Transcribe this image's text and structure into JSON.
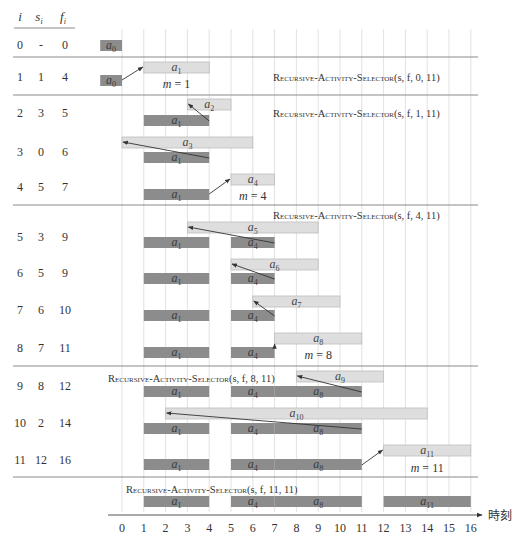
{
  "table_header": {
    "i": "i",
    "s": "s",
    "s_sub": "i",
    "f": "f",
    "f_sub": "i"
  },
  "colors": {
    "selected_bar": "#8c8c8c",
    "candidate_bar": "#dedede",
    "candidate_border": "#bdbdbd",
    "grid": "#e2e2e2",
    "separator": "#8a8a8a",
    "arrow": "#333333"
  },
  "axis": {
    "label": "時刻",
    "ticks": [
      "0",
      "1",
      "2",
      "3",
      "4",
      "5",
      "6",
      "7",
      "8",
      "9",
      "10",
      "11",
      "12",
      "13",
      "14",
      "15",
      "16"
    ]
  },
  "calls": [
    {
      "name": "Recursive-Activity-Selector",
      "args": "(s, f, 0, 11)",
      "y": 77,
      "x": 273
    },
    {
      "name": "Recursive-Activity-Selector",
      "args": "(s, f, 1, 11)",
      "y": 113,
      "x": 273
    },
    {
      "name": "Recursive-Activity-Selector",
      "args": "(s, f, 4, 11)",
      "y": 215,
      "x": 273
    },
    {
      "name": "Recursive-Activity-Selector",
      "args": "(s, f, 8, 11)",
      "y": 378,
      "x": 108
    },
    {
      "name": "Recursive-Activity-Selector",
      "args": "(s, f, 11, 11)",
      "y": 489,
      "x": 126
    }
  ],
  "separators": [
    57,
    95,
    205,
    366,
    477
  ],
  "chart_data": {
    "type": "table",
    "xlabel": "時刻",
    "xlim": [
      0,
      16
    ],
    "columns": [
      "i",
      "s_i",
      "f_i"
    ],
    "rows": [
      {
        "i": "0",
        "s": "-",
        "f": "0",
        "label_y": 45,
        "candidate": null,
        "selected": [
          {
            "name": "a",
            "sub": "0",
            "s": -1,
            "f": 0
          }
        ],
        "sel_y": 40,
        "arrow": null,
        "m": null
      },
      {
        "i": "1",
        "s": "1",
        "f": "4",
        "label_y": 77,
        "candidate": {
          "name": "a",
          "sub": "1",
          "s": 1,
          "f": 4,
          "y": 62
        },
        "selected": [
          {
            "name": "a",
            "sub": "0",
            "s": -1,
            "f": 0
          }
        ],
        "sel_y": 75,
        "arrow": {
          "from": [
            0,
            80
          ],
          "to": [
            1,
            67
          ]
        },
        "m": {
          "text": "m = 1",
          "x": 2.5,
          "y": 88
        }
      },
      {
        "i": "2",
        "s": "3",
        "f": "5",
        "label_y": 113,
        "candidate": {
          "name": "a",
          "sub": "2",
          "s": 3,
          "f": 5,
          "y": 99
        },
        "selected": [
          {
            "name": "a",
            "sub": "1",
            "s": 1,
            "f": 4
          }
        ],
        "sel_y": 115,
        "arrow": {
          "from": [
            4,
            121
          ],
          "to": [
            3,
            104
          ]
        },
        "m": null
      },
      {
        "i": "3",
        "s": "0",
        "f": "6",
        "label_y": 152,
        "candidate": {
          "name": "a",
          "sub": "3",
          "s": 0,
          "f": 6,
          "y": 137
        },
        "selected": [
          {
            "name": "a",
            "sub": "1",
            "s": 1,
            "f": 4
          }
        ],
        "sel_y": 152,
        "arrow": {
          "from": [
            4,
            158
          ],
          "to": [
            0,
            142
          ]
        },
        "m": null
      },
      {
        "i": "4",
        "s": "5",
        "f": "7",
        "label_y": 187,
        "candidate": {
          "name": "a",
          "sub": "4",
          "s": 5,
          "f": 7,
          "y": 174
        },
        "selected": [
          {
            "name": "a",
            "sub": "1",
            "s": 1,
            "f": 4
          }
        ],
        "sel_y": 189,
        "arrow": {
          "from": [
            4,
            194
          ],
          "to": [
            5,
            179
          ]
        },
        "m": {
          "text": "m = 4",
          "x": 6,
          "y": 200
        }
      },
      {
        "i": "5",
        "s": "3",
        "f": "9",
        "label_y": 237,
        "candidate": {
          "name": "a",
          "sub": "5",
          "s": 3,
          "f": 9,
          "y": 222
        },
        "selected": [
          {
            "name": "a",
            "sub": "1",
            "s": 1,
            "f": 4
          },
          {
            "name": "a",
            "sub": "4",
            "s": 5,
            "f": 7
          }
        ],
        "sel_y": 237,
        "arrow": {
          "from": [
            7,
            243
          ],
          "to": [
            3,
            227
          ]
        },
        "m": null
      },
      {
        "i": "6",
        "s": "5",
        "f": "9",
        "label_y": 273,
        "candidate": {
          "name": "a",
          "sub": "6",
          "s": 5,
          "f": 9,
          "y": 259
        },
        "selected": [
          {
            "name": "a",
            "sub": "1",
            "s": 1,
            "f": 4
          },
          {
            "name": "a",
            "sub": "4",
            "s": 5,
            "f": 7
          }
        ],
        "sel_y": 273,
        "arrow": {
          "from": [
            7,
            279
          ],
          "to": [
            5,
            264
          ]
        },
        "m": null
      },
      {
        "i": "7",
        "s": "6",
        "f": "10",
        "label_y": 310,
        "candidate": {
          "name": "a",
          "sub": "7",
          "s": 6,
          "f": 10,
          "y": 296
        },
        "selected": [
          {
            "name": "a",
            "sub": "1",
            "s": 1,
            "f": 4
          },
          {
            "name": "a",
            "sub": "4",
            "s": 5,
            "f": 7
          }
        ],
        "sel_y": 310,
        "arrow": {
          "from": [
            7,
            316
          ],
          "to": [
            6,
            301
          ]
        },
        "m": null
      },
      {
        "i": "8",
        "s": "7",
        "f": "11",
        "label_y": 348,
        "candidate": {
          "name": "a",
          "sub": "8",
          "s": 7,
          "f": 11,
          "y": 333
        },
        "selected": [
          {
            "name": "a",
            "sub": "1",
            "s": 1,
            "f": 4
          },
          {
            "name": "a",
            "sub": "4",
            "s": 5,
            "f": 7
          }
        ],
        "sel_y": 347,
        "arrow": {
          "from": [
            7,
            347
          ],
          "to": [
            7,
            344
          ]
        },
        "m": {
          "text": "m = 8",
          "x": 9,
          "y": 359
        }
      },
      {
        "i": "9",
        "s": "8",
        "f": "12",
        "label_y": 386,
        "candidate": {
          "name": "a",
          "sub": "9",
          "s": 8,
          "f": 12,
          "y": 371
        },
        "selected": [
          {
            "name": "a",
            "sub": "1",
            "s": 1,
            "f": 4
          },
          {
            "name": "a",
            "sub": "4",
            "s": 5,
            "f": 7
          },
          {
            "name": "a",
            "sub": "8",
            "s": 7,
            "f": 11
          }
        ],
        "sel_y": 386,
        "arrow": {
          "from": [
            11,
            392
          ],
          "to": [
            8,
            376
          ]
        },
        "m": null
      },
      {
        "i": "10",
        "s": "2",
        "f": "14",
        "label_y": 423,
        "candidate": {
          "name": "a",
          "sub": "10",
          "s": 2,
          "f": 14,
          "y": 408
        },
        "selected": [
          {
            "name": "a",
            "sub": "1",
            "s": 1,
            "f": 4
          },
          {
            "name": "a",
            "sub": "4",
            "s": 5,
            "f": 7
          },
          {
            "name": "a",
            "sub": "8",
            "s": 7,
            "f": 11
          }
        ],
        "sel_y": 423,
        "arrow": {
          "from": [
            11,
            429
          ],
          "to": [
            2,
            413
          ]
        },
        "m": null
      },
      {
        "i": "11",
        "s": "12",
        "f": "16",
        "label_y": 460,
        "candidate": {
          "name": "a",
          "sub": "11",
          "s": 12,
          "f": 16,
          "y": 445
        },
        "selected": [
          {
            "name": "a",
            "sub": "1",
            "s": 1,
            "f": 4
          },
          {
            "name": "a",
            "sub": "4",
            "s": 5,
            "f": 7
          },
          {
            "name": "a",
            "sub": "8",
            "s": 7,
            "f": 11
          }
        ],
        "sel_y": 459,
        "arrow": {
          "from": [
            11,
            465
          ],
          "to": [
            12,
            450
          ]
        },
        "m": {
          "text": "m = 11",
          "x": 14,
          "y": 472
        }
      }
    ],
    "final": {
      "selected": [
        {
          "name": "a",
          "sub": "1",
          "s": 1,
          "f": 4
        },
        {
          "name": "a",
          "sub": "4",
          "s": 5,
          "f": 7
        },
        {
          "name": "a",
          "sub": "8",
          "s": 7,
          "f": 11
        },
        {
          "name": "a",
          "sub": "11",
          "s": 12,
          "f": 16
        }
      ],
      "sel_y": 496
    },
    "result": [
      "a1",
      "a4",
      "a8",
      "a11"
    ]
  }
}
